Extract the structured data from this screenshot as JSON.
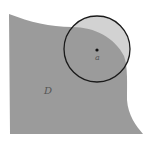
{
  "diagram": {
    "region_label": "D",
    "point_label": "a",
    "colors": {
      "background": "#ffffff",
      "region_fill": "#9b9b9b",
      "outside_disk_fill": "#d2d2d2",
      "circle_stroke": "#1a1a1a",
      "point": "#111111",
      "label": "#555555"
    }
  }
}
